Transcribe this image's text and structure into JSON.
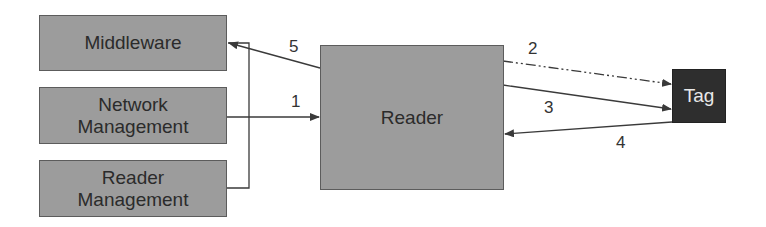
{
  "diagram": {
    "nodes": {
      "middleware": {
        "label": "Middleware"
      },
      "network_management": {
        "label": "Network Management",
        "line1": "Network",
        "line2": "Management"
      },
      "reader_management": {
        "label": "Reader Management",
        "line1": "Reader",
        "line2": "Management"
      },
      "reader": {
        "label": "Reader"
      },
      "tag": {
        "label": "Tag"
      }
    },
    "edges": [
      {
        "id": "1",
        "label": "1",
        "from": "Network Management",
        "to": "Reader",
        "style": "solid"
      },
      {
        "id": "2",
        "label": "2",
        "from": "Reader",
        "to": "Tag",
        "style": "dash-dot"
      },
      {
        "id": "3",
        "label": "3",
        "from": "Reader",
        "to": "Tag",
        "style": "solid"
      },
      {
        "id": "4",
        "label": "4",
        "from": "Tag",
        "to": "Reader",
        "style": "solid"
      },
      {
        "id": "5",
        "label": "5",
        "from": "Reader",
        "to": "Middleware / Network Management / Reader Management",
        "style": "solid"
      }
    ],
    "colors": {
      "box_fill": "#9c9c9c",
      "tag_fill": "#2e2e2e",
      "line": "#3a3a3a"
    }
  }
}
